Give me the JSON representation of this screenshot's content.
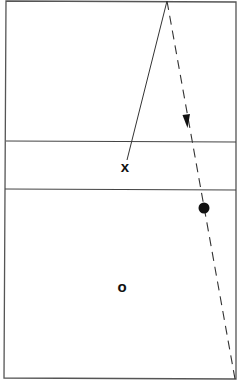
{
  "diagram": {
    "type": "court-trajectory",
    "colors": {
      "line": "#333333",
      "border": "#555555",
      "marker": "#111111",
      "background": "#ffffff"
    },
    "court": {
      "top_left": [
        6,
        1
      ],
      "top_right": [
        236,
        2
      ],
      "bottom_right": [
        236,
        379
      ],
      "bottom_left": [
        4,
        378
      ],
      "divider_lines_y": [
        141,
        189
      ]
    },
    "solid_path": {
      "from": [
        167,
        1
      ],
      "to": [
        127,
        160
      ]
    },
    "dashed_path": {
      "from": [
        167,
        1
      ],
      "to": [
        235,
        379
      ],
      "arrow_at": [
        187,
        127
      ]
    },
    "markers": {
      "x_marker": {
        "label": "x",
        "position": [
          125,
          167
        ]
      },
      "o_marker": {
        "label": "o",
        "position": [
          122,
          287
        ]
      },
      "filled_dot": {
        "position": [
          204,
          208
        ],
        "radius": 5.5
      }
    }
  }
}
